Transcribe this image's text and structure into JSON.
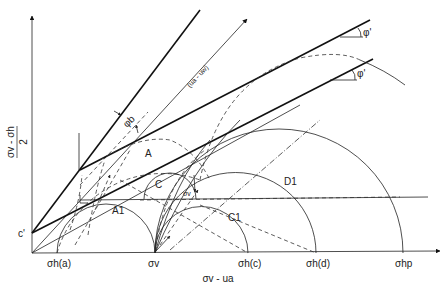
{
  "diagram": {
    "axes": {
      "y_label_numerator": "σv - σh",
      "y_label_denominator": "2",
      "x_label": "σv - ua",
      "intercept_label": "c'"
    },
    "x_ticks": [
      {
        "id": "sigma-h-a",
        "label": "σh(a)"
      },
      {
        "id": "sigma-v",
        "label": "σv"
      },
      {
        "id": "sigma-h-c",
        "label": "σh(c)"
      },
      {
        "id": "sigma-h-d",
        "label": "σh(d)"
      },
      {
        "id": "sigma-hp",
        "label": "σhp"
      }
    ],
    "circle_labels": {
      "A": "A",
      "A1": "A1",
      "C": "C",
      "C1": "C1",
      "D1": "D1"
    },
    "annotations": {
      "suction_axis": "(ua - uw)",
      "phi_b": "φb",
      "phi_prime_top": "φ'",
      "phi_prime_bottom": "φ'",
      "sigma_v_mid": "σv"
    }
  }
}
